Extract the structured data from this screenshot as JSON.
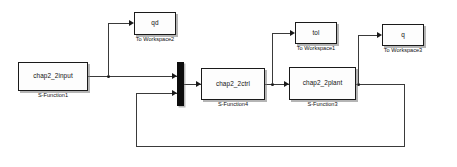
{
  "diagram": {
    "background_color": "#ffffff",
    "line_color": "#3a3a3a",
    "block_fill": "#fdfdfd",
    "block_border": "#1a1a1a",
    "mux_color": "#0d0d0d"
  },
  "blocks": [
    {
      "id": "input",
      "label": "chap2_2input",
      "caption": "S-Function1"
    },
    {
      "id": "qd",
      "label": "qd",
      "caption": "To Workspace2"
    },
    {
      "id": "ctrl",
      "label": "chap2_2ctrl",
      "caption": "S-Function4"
    },
    {
      "id": "tol",
      "label": "tol",
      "caption": "To Workspace1"
    },
    {
      "id": "plant",
      "label": "chap2_2plant",
      "caption": "S-Function3"
    },
    {
      "id": "q",
      "label": "q",
      "caption": "To Workspace3"
    }
  ],
  "mux": {
    "name": "mux",
    "inputs": 2,
    "outputs": 1
  }
}
